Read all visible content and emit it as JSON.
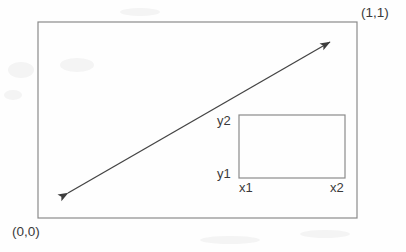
{
  "figure": {
    "title_text": "",
    "colors": {
      "background": "#fefefe",
      "outer_rect_stroke": "#8a8a8a",
      "inner_rect_stroke": "#8a8a8a",
      "arrow_stroke": "#444444",
      "label_text": "#3a3a3a"
    },
    "outer_rect": {
      "name": "unit-square",
      "x": 38,
      "y": 22,
      "width": 319,
      "height": 196,
      "stroke_width": 1.2
    },
    "inner_rect": {
      "name": "bounding-box",
      "x": 239,
      "y": 115,
      "width": 106,
      "height": 63,
      "stroke_width": 1.2
    },
    "arrow": {
      "name": "diagonal-double-arrow",
      "x1": 68,
      "y1": 193,
      "x2": 330,
      "y2": 42,
      "stroke_width": 1.3,
      "double_headed": true
    },
    "labels": {
      "origin": "(0,0)",
      "unit_corner": "(1,1)",
      "y_top": "y2",
      "y_bottom": "y1",
      "x_left": "x1",
      "x_right": "x2"
    }
  },
  "chart_data": {
    "type": "diagram",
    "title": "",
    "xlabel": "",
    "ylabel": "",
    "xlim": [
      0,
      1
    ],
    "ylim": [
      0,
      1
    ],
    "grid": false,
    "legend": null,
    "annotations": [
      {
        "text": "(0,0)",
        "x": 0,
        "y": 0,
        "position": "below-left-of-outer-rect"
      },
      {
        "text": "(1,1)",
        "x": 1,
        "y": 1,
        "position": "above-right-of-outer-rect"
      },
      {
        "text": "y2",
        "x": 0.63,
        "y": 0.525,
        "position": "left-of-inner-rect-top"
      },
      {
        "text": "y1",
        "x": 0.63,
        "y": 0.204,
        "position": "left-of-inner-rect-bottom"
      },
      {
        "text": "x1",
        "x": 0.63,
        "y": 0.204,
        "position": "below-inner-rect-left"
      },
      {
        "text": "x2",
        "x": 0.962,
        "y": 0.204,
        "position": "below-inner-rect-right"
      }
    ],
    "shapes": [
      {
        "kind": "rect",
        "name": "unit-square",
        "x0": 0,
        "y0": 0,
        "x1": 1,
        "y1": 1
      },
      {
        "kind": "rect",
        "name": "bounding-box",
        "x0": 0.63,
        "y0": 0.204,
        "x1": 0.962,
        "y1": 0.525
      },
      {
        "kind": "arrow",
        "name": "diagonal-double-arrow",
        "x0": 0.094,
        "y0": 0.128,
        "x1": 0.915,
        "y1": 0.898,
        "double_headed": true
      }
    ]
  }
}
